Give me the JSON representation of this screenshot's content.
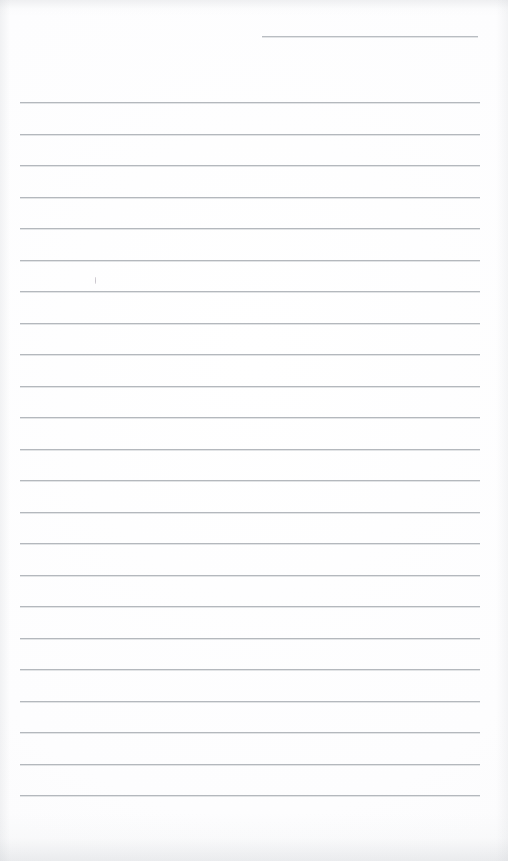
{
  "document": {
    "kind": "scanned-lined-paper",
    "title": "Blank Ruled Notebook Page",
    "page_width": 508,
    "page_height": 861,
    "background_color": "#ffffff",
    "rule_color": "#b4b8bd",
    "rule_thickness_px": 1,
    "body_text": "",
    "has_handwriting": false
  },
  "header_rule": {
    "name": "date-or-heading-rule",
    "x": 262,
    "y": 36,
    "width": 216,
    "label": ""
  },
  "body_rules": {
    "count": 23,
    "first_y": 102,
    "spacing_px": 31.5,
    "left_x": 20,
    "width": 460,
    "lines": [
      {
        "index": 1,
        "y": 102,
        "text": ""
      },
      {
        "index": 2,
        "y": 134,
        "text": ""
      },
      {
        "index": 3,
        "y": 165,
        "text": ""
      },
      {
        "index": 4,
        "y": 197,
        "text": ""
      },
      {
        "index": 5,
        "y": 228,
        "text": ""
      },
      {
        "index": 6,
        "y": 260,
        "text": ""
      },
      {
        "index": 7,
        "y": 291,
        "text": ""
      },
      {
        "index": 8,
        "y": 323,
        "text": ""
      },
      {
        "index": 9,
        "y": 354,
        "text": ""
      },
      {
        "index": 10,
        "y": 386,
        "text": ""
      },
      {
        "index": 11,
        "y": 417,
        "text": ""
      },
      {
        "index": 12,
        "y": 449,
        "text": ""
      },
      {
        "index": 13,
        "y": 480,
        "text": ""
      },
      {
        "index": 14,
        "y": 512,
        "text": ""
      },
      {
        "index": 15,
        "y": 543,
        "text": ""
      },
      {
        "index": 16,
        "y": 575,
        "text": ""
      },
      {
        "index": 17,
        "y": 606,
        "text": ""
      },
      {
        "index": 18,
        "y": 638,
        "text": ""
      },
      {
        "index": 19,
        "y": 669,
        "text": ""
      },
      {
        "index": 20,
        "y": 701,
        "text": ""
      },
      {
        "index": 21,
        "y": 732,
        "text": ""
      },
      {
        "index": 22,
        "y": 764,
        "text": ""
      },
      {
        "index": 23,
        "y": 795,
        "text": ""
      }
    ]
  },
  "stray_marks": [
    {
      "name": "pen-tick-mark",
      "x": 95,
      "y": 277,
      "width": 1,
      "height": 7
    }
  ]
}
